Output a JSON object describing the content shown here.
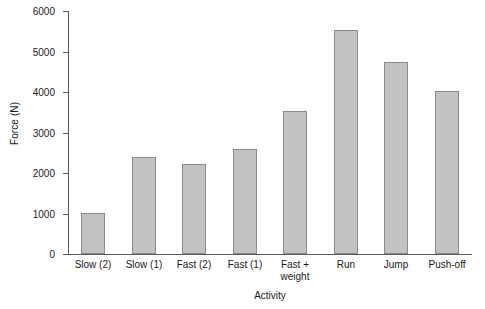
{
  "chart_data": {
    "type": "bar",
    "title": "",
    "xlabel": "Activity",
    "ylabel": "Force (N)",
    "categories": [
      "Slow (2)",
      "Slow (1)",
      "Fast (2)",
      "Fast (1)",
      "Fast +\nweight",
      "Run",
      "Jump",
      "Push-off"
    ],
    "category_lines": [
      [
        "Slow (2)"
      ],
      [
        "Slow (1)"
      ],
      [
        "Fast (2)"
      ],
      [
        "Fast (1)"
      ],
      [
        "Fast +",
        "weight"
      ],
      [
        "Run"
      ],
      [
        "Jump"
      ],
      [
        "Push-off"
      ]
    ],
    "values": [
      1020,
      2400,
      2220,
      2600,
      3520,
      5540,
      4740,
      4030
    ],
    "ylim": [
      0,
      6000
    ],
    "yticks": [
      0,
      1000,
      2000,
      3000,
      4000,
      5000,
      6000
    ],
    "ytick_labels": [
      "0",
      "1000",
      "2000",
      "3000",
      "4000",
      "5000",
      "6000"
    ],
    "grid": false,
    "legend": false,
    "bar_fill_color": "#c2c2c2",
    "bar_border_color": "#8a8a8a",
    "axis_color": "#5a5a5a"
  }
}
